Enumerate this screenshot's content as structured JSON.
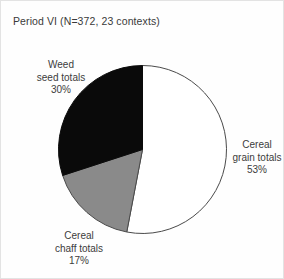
{
  "chart_data": {
    "type": "pie",
    "title": "Period VI (N=372, 23 contexts)",
    "categories": [
      "Cereal grain totals",
      "Cereal chaff totals",
      "Weed seed totals"
    ],
    "values": [
      53,
      17,
      30
    ],
    "unit": "%",
    "total_n": 372,
    "contexts": 23,
    "start_angle_deg": 0,
    "direction": "clockwise",
    "legend": "none",
    "labels_position": "outside",
    "slices": [
      {
        "name": "Cereal grain totals",
        "value": 53,
        "value_text": "53%",
        "color": "#ffffff",
        "stroke": "#4a4a4a",
        "start_deg": 0,
        "end_deg": 190.8
      },
      {
        "name": "Cereal chaff totals",
        "value": 17,
        "value_text": "17%",
        "color": "#8a8a8a",
        "stroke": "#4a4a4a",
        "start_deg": 190.8,
        "end_deg": 252.0
      },
      {
        "name": "Weed seed totals",
        "value": 30,
        "value_text": "30%",
        "color": "#0a0a0a",
        "stroke": "#0a0a0a",
        "start_deg": 252.0,
        "end_deg": 360.0
      }
    ]
  },
  "labels": {
    "weed": {
      "line1": "Weed",
      "line2": "seed totals",
      "pct": "30%"
    },
    "cereal_grain": {
      "line1": "Cereal",
      "line2": "grain totals",
      "pct": "53%"
    },
    "cereal_chaff": {
      "line1": "Cereal",
      "line2": "chaff totals",
      "pct": "17%"
    }
  },
  "colors": {
    "white_slice": "#ffffff",
    "gray_slice": "#8a8a8a",
    "black_slice": "#0a0a0a",
    "outline": "#4a4a4a",
    "text": "#3c3c3c",
    "background": "#fefefe"
  }
}
